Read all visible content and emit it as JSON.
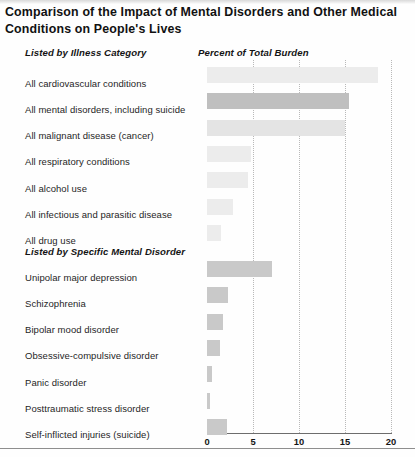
{
  "title": "Comparison of the Impact of Mental Disorders and Other Medical Conditions on  People's Lives",
  "sections": {
    "category_heading": "Listed by Illness Category",
    "value_heading": "Percent of Total Burden",
    "specific_heading": "Listed by Specific Mental Disorder"
  },
  "colors": {
    "bar_light": "#ececec",
    "bar_mid_light": "#e4e4e4",
    "bar_highlight": "#bfbfbf",
    "bar_section2": "#c9c9c9",
    "axis": "#6d6d6d",
    "grid": "#b9b9b9",
    "text": "#1b1b1b"
  },
  "chart_data": {
    "type": "bar",
    "orientation": "horizontal",
    "title": "Comparison of the Impact of Mental Disorders and Other Medical Conditions on  People's Lives",
    "xlabel": "Percent of Total Burden",
    "ylabel": "",
    "xlim": [
      0,
      20
    ],
    "xticks": [
      0,
      5,
      10,
      15,
      20
    ],
    "xtick_labels": [
      "0",
      "5",
      "10",
      "15",
      "20"
    ],
    "grid": true,
    "legend": false,
    "groups": [
      {
        "name": "Listed by Illness Category",
        "categories": [
          "All cardiovascular conditions",
          "All mental disorders, including suicide",
          "All malignant disease (cancer)",
          "All respiratory conditions",
          "All alcohol use",
          "All  infectious and parasitic disease",
          "All drug use"
        ],
        "values": [
          18.6,
          15.4,
          15.0,
          4.8,
          4.5,
          2.8,
          1.5
        ],
        "highlight_index": 1
      },
      {
        "name": "Listed by Specific Mental Disorder",
        "categories": [
          "Unipolar major depression",
          "Schizophrenia",
          "Bipolar mood disorder",
          "Obsessive-compulsive disorder",
          "Panic disorder",
          "Posttraumatic stress disorder",
          "Self-inflicted injuries (suicide)"
        ],
        "values": [
          7.1,
          2.3,
          1.7,
          1.4,
          0.5,
          0.3,
          2.2
        ],
        "highlight_index": null
      }
    ]
  }
}
